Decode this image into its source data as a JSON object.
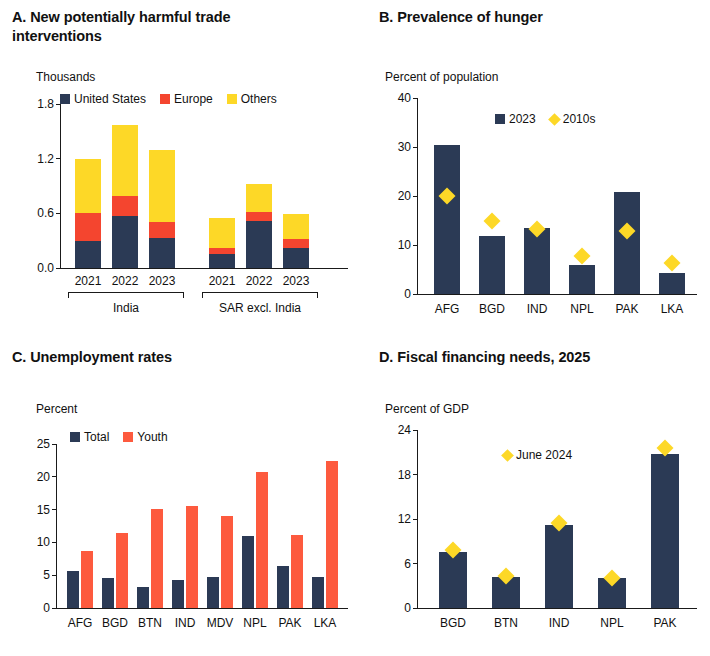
{
  "colors": {
    "navy": "#2b3a55",
    "red": "#f4452f",
    "yellow": "#fdd827",
    "axis": "#1a1a1a"
  },
  "panelA": {
    "title": "A. New potentially harmful trade interventions",
    "unit": "Thousands",
    "legend": [
      {
        "label": "United States",
        "color": "#2b3a55",
        "shape": "square"
      },
      {
        "label": "Europe",
        "color": "#f4452f",
        "shape": "square"
      },
      {
        "label": "Others",
        "color": "#fdd827",
        "shape": "square"
      }
    ],
    "group_labels": [
      "India",
      "SAR excl. India"
    ]
  },
  "panelB": {
    "title": "B. Prevalence of hunger",
    "unit": "Percent of population",
    "legend": [
      {
        "label": "2023",
        "color": "#2b3a55",
        "shape": "square"
      },
      {
        "label": "2010s",
        "color": "#fdd827",
        "shape": "diamond"
      }
    ]
  },
  "panelC": {
    "title": "C. Unemployment rates",
    "unit": "Percent",
    "legend": [
      {
        "label": "Total",
        "color": "#2b3a55",
        "shape": "square"
      },
      {
        "label": "Youth",
        "color": "#fd5a3e",
        "shape": "square"
      }
    ]
  },
  "panelD": {
    "title": "D. Fiscal financing needs, 2025",
    "unit": "Percent of GDP",
    "legend": [
      {
        "label": "June 2024",
        "color": "#fdd827",
        "shape": "diamond"
      }
    ]
  },
  "chart_data": [
    {
      "id": "A",
      "type": "bar",
      "stacked": true,
      "title": "A. New potentially harmful trade interventions",
      "ylabel": "Thousands",
      "ylim": [
        0.0,
        1.8
      ],
      "yticks": [
        0.0,
        0.6,
        1.2,
        1.8
      ],
      "ytick_labels": [
        "0.0",
        "0.6",
        "1.2",
        "1.8"
      ],
      "categories": [
        "2021",
        "2022",
        "2023",
        "2021",
        "2022",
        "2023"
      ],
      "groups": [
        {
          "label": "India",
          "categories": [
            "2021",
            "2022",
            "2023"
          ]
        },
        {
          "label": "SAR excl. India",
          "categories": [
            "2021",
            "2022",
            "2023"
          ]
        }
      ],
      "series": [
        {
          "name": "United States",
          "color": "#2b3a55",
          "values": [
            0.3,
            0.57,
            0.33,
            0.15,
            0.52,
            0.22
          ]
        },
        {
          "name": "Europe",
          "color": "#f4452f",
          "values": [
            0.3,
            0.22,
            0.17,
            0.07,
            0.1,
            0.1
          ]
        },
        {
          "name": "Others",
          "color": "#fdd827",
          "values": [
            0.6,
            0.78,
            0.8,
            0.33,
            0.3,
            0.27
          ]
        }
      ],
      "totals": [
        1.2,
        1.57,
        1.3,
        0.55,
        0.92,
        0.59
      ],
      "grid": false,
      "legend_position": "top"
    },
    {
      "id": "B",
      "type": "bar",
      "title": "B. Prevalence of hunger",
      "ylabel": "Percent of population",
      "ylim": [
        0,
        40
      ],
      "yticks": [
        0,
        10,
        20,
        30,
        40
      ],
      "ytick_labels": [
        "0",
        "10",
        "20",
        "30",
        "40"
      ],
      "categories": [
        "AFG",
        "BGD",
        "IND",
        "NPL",
        "PAK",
        "LKA"
      ],
      "series": [
        {
          "name": "2023",
          "color": "#2b3a55",
          "type": "bar",
          "values": [
            30.4,
            11.9,
            13.4,
            5.9,
            20.8,
            4.3
          ]
        },
        {
          "name": "2010s",
          "color": "#fdd827",
          "type": "marker",
          "marker": "diamond",
          "values": [
            19.9,
            14.8,
            13.2,
            7.8,
            12.8,
            6.3
          ]
        }
      ],
      "grid": false,
      "legend_position": "top"
    },
    {
      "id": "C",
      "type": "bar",
      "title": "C. Unemployment rates",
      "ylabel": "Percent",
      "ylim": [
        0,
        25
      ],
      "yticks": [
        0,
        5,
        10,
        15,
        20,
        25
      ],
      "ytick_labels": [
        "0",
        "5",
        "10",
        "15",
        "20",
        "25"
      ],
      "categories": [
        "AFG",
        "BGD",
        "BTN",
        "IND",
        "MDV",
        "NPL",
        "PAK",
        "LKA"
      ],
      "series": [
        {
          "name": "Total",
          "color": "#2b3a55",
          "values": [
            5.7,
            4.6,
            3.2,
            4.2,
            4.7,
            10.9,
            6.4,
            4.7
          ]
        },
        {
          "name": "Youth",
          "color": "#fd5a3e",
          "values": [
            8.7,
            11.5,
            15.1,
            15.5,
            14.0,
            20.8,
            11.2,
            22.4
          ]
        }
      ],
      "grid": false,
      "legend_position": "top"
    },
    {
      "id": "D",
      "type": "bar",
      "title": "D. Fiscal financing needs, 2025",
      "ylabel": "Percent of GDP",
      "ylim": [
        0,
        24
      ],
      "yticks": [
        0,
        6,
        12,
        18,
        24
      ],
      "ytick_labels": [
        "0",
        "6",
        "12",
        "18",
        "24"
      ],
      "categories": [
        "BGD",
        "BTN",
        "IND",
        "NPL",
        "PAK"
      ],
      "series": [
        {
          "name": "2025",
          "color": "#2b3a55",
          "type": "bar",
          "values": [
            7.6,
            4.2,
            11.2,
            4.0,
            20.8
          ]
        },
        {
          "name": "June 2024",
          "color": "#fdd827",
          "type": "marker",
          "marker": "diamond",
          "values": [
            7.8,
            4.3,
            11.4,
            4.1,
            21.6
          ]
        }
      ],
      "grid": false,
      "legend_position": "top"
    }
  ]
}
